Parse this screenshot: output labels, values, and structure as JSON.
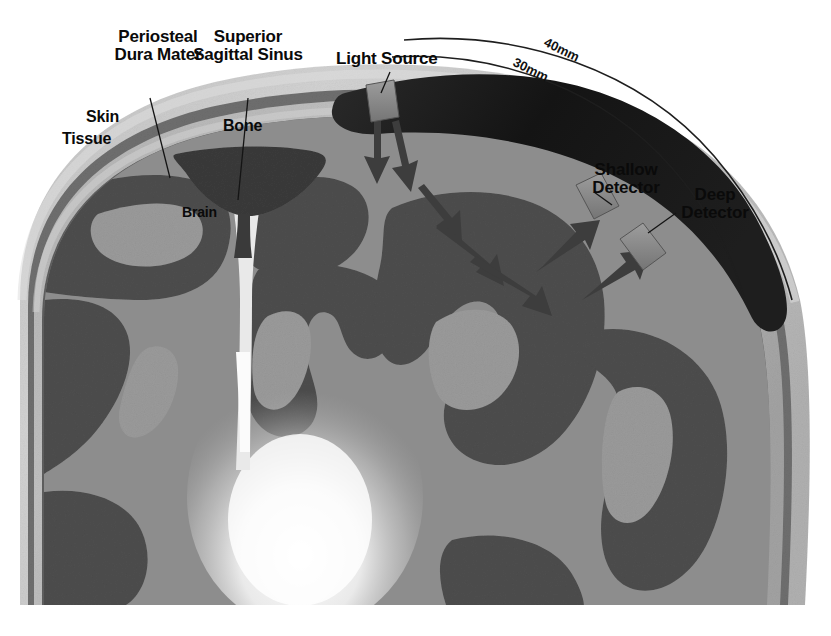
{
  "figure": {
    "type": "anatomical-cross-section",
    "background_color": "#ffffff"
  },
  "labels": {
    "skin": "Skin",
    "tissue": "Tissue",
    "periosteal_dura_mater": "Periosteal\nDura Mater",
    "superior_sagittal_sinus": "Superior\nSagittal Sinus",
    "bone": "Bone",
    "brain": "Brain",
    "light_source": "Light Source",
    "shallow_detector": "Shallow\nDetector",
    "deep_detector": "Deep\nDetector"
  },
  "distances": {
    "outer_arc": "40mm",
    "inner_arc": "30mm"
  },
  "colors": {
    "skin_layer": "#b7b7b7",
    "skin_highlight": "#cfcfcf",
    "dura_line": "#6f6f6f",
    "bone_layer": "#a8a8a8",
    "brain_gray_matter": "#8f8f8f",
    "brain_dark_matter": "#4e4e4e",
    "sinus": "#3c3c3c",
    "optode_pad": "#171717",
    "optode_block": "#8a8a8a",
    "glow": "#fdfdfd",
    "arrow": "#3a3a3a",
    "label_text": "#0a0a0a",
    "leader_line": "#222222"
  },
  "elements": {
    "layers": [
      "Skin / Tissue",
      "Periosteal Dura Mater",
      "Bone",
      "Superior Sagittal Sinus",
      "Brain"
    ],
    "optodes": [
      "Light Source",
      "Shallow Detector",
      "Deep Detector"
    ],
    "photon_paths": 6,
    "arc_count": 2
  }
}
